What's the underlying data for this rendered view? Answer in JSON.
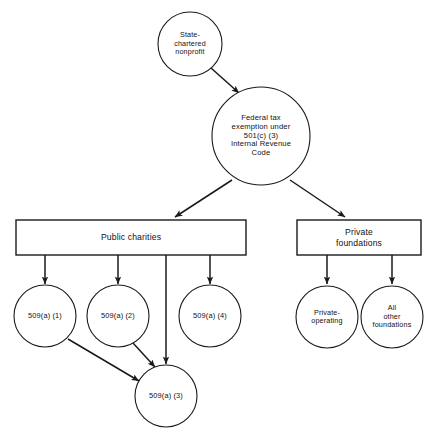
{
  "diagram": {
    "nodes": {
      "state_nonprofit": {
        "label": "State-\nchartered\nnonprofit",
        "shape": "circle"
      },
      "federal_exemption": {
        "label": "Federal tax\nexemption under\n501(c) (3)\nInternal Revenue\nCode",
        "shape": "circle"
      },
      "public_charities": {
        "label": "Public charities",
        "shape": "rectangle"
      },
      "private_foundations": {
        "label": "Private\nfoundations",
        "shape": "rectangle"
      },
      "sec_509a1": {
        "label": "509(a) (1)",
        "shape": "circle"
      },
      "sec_509a2": {
        "label": "509(a) (2)",
        "shape": "circle"
      },
      "sec_509a4": {
        "label": "509(a) (4)",
        "shape": "circle"
      },
      "sec_509a3": {
        "label": "509(a) (3)",
        "shape": "circle"
      },
      "private_operating": {
        "label": "Private-\noperating",
        "shape": "circle"
      },
      "all_other_foundations": {
        "label": "All\nother\nfoundations",
        "shape": "circle"
      }
    },
    "edges": [
      {
        "from": "state_nonprofit",
        "to": "federal_exemption",
        "arrow": true
      },
      {
        "from": "federal_exemption",
        "to": "public_charities",
        "arrow": true
      },
      {
        "from": "federal_exemption",
        "to": "private_foundations",
        "arrow": true
      },
      {
        "from": "public_charities",
        "to": "sec_509a1",
        "arrow": true
      },
      {
        "from": "public_charities",
        "to": "sec_509a2",
        "arrow": true
      },
      {
        "from": "public_charities",
        "to": "sec_509a3",
        "arrow": true
      },
      {
        "from": "public_charities",
        "to": "sec_509a4",
        "arrow": true
      },
      {
        "from": "sec_509a1",
        "to": "sec_509a3",
        "arrow": true
      },
      {
        "from": "sec_509a2",
        "to": "sec_509a3",
        "arrow": true
      },
      {
        "from": "private_foundations",
        "to": "private_operating",
        "arrow": true
      },
      {
        "from": "private_foundations",
        "to": "all_other_foundations",
        "arrow": true
      }
    ],
    "colors": {
      "background": "#ffffff",
      "stroke": "#1a1a1a",
      "text": "#111111"
    }
  }
}
